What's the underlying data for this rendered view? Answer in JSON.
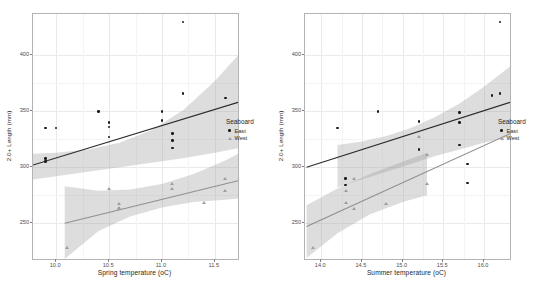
{
  "figure": {
    "panels": [
      "spring",
      "summer"
    ],
    "legend": {
      "title": "Seaboard",
      "items": [
        {
          "label": "East",
          "marker": "filled-circle",
          "color": "#1b1b1b"
        },
        {
          "label": "West",
          "marker": "open-triangle",
          "color": "#9e9e9e"
        }
      ]
    }
  },
  "chart_data": [
    {
      "type": "scatter",
      "panel": "spring",
      "title": "",
      "xlabel": "Spring temperature (oC)",
      "ylabel": "2.0+ Length (mm)",
      "xlim": [
        9.78,
        11.72
      ],
      "ylim": [
        218,
        437
      ],
      "xticks": [
        "10.0",
        "10.5",
        "11.0",
        "11.5"
      ],
      "xtick_values": [
        10.0,
        10.5,
        11.0,
        11.5
      ],
      "yticks": [
        "250",
        "300",
        "350",
        "400"
      ],
      "ytick_values": [
        250,
        300,
        350,
        400
      ],
      "grid": true,
      "legend_position": "right",
      "series": [
        {
          "name": "East",
          "color": "#1b1b1b",
          "marker": "filled-circle",
          "x": [
            9.9,
            9.9,
            9.9,
            10.0,
            10.4,
            10.5,
            10.5,
            10.5,
            11.0,
            11.0,
            11.1,
            11.1,
            11.1,
            11.2,
            11.2,
            11.6
          ],
          "y": [
            308,
            305,
            335,
            335,
            350,
            340,
            336,
            327,
            350,
            342,
            330,
            324,
            317,
            430,
            366,
            362
          ],
          "fit": {
            "x0": 9.78,
            "y0": 302,
            "x1": 11.72,
            "y1": 358
          },
          "band": {
            "x": [
              9.78,
              10.0,
              10.3,
              10.6,
              10.9,
              11.2,
              11.5,
              11.72
            ],
            "upper": [
              312,
              313,
              316,
              322,
              333,
              351,
              377,
              400
            ],
            "lower": [
              289,
              292,
              296,
              300,
              304,
              308,
              313,
              317
            ]
          }
        },
        {
          "name": "West",
          "color": "#9e9e9e",
          "marker": "open-triangle",
          "x": [
            10.1,
            10.5,
            10.6,
            10.6,
            10.6,
            11.1,
            11.1,
            11.4,
            11.6,
            11.6
          ],
          "y": [
            228,
            281,
            267,
            264,
            263,
            285,
            281,
            268,
            290,
            279
          ],
          "fit": {
            "x0": 10.08,
            "y0": 250,
            "x1": 11.72,
            "y1": 288
          },
          "band": {
            "x": [
              10.08,
              10.4,
              10.7,
              11.0,
              11.3,
              11.6,
              11.72
            ],
            "upper": [
              283,
              279,
              280,
              285,
              294,
              306,
              312
            ],
            "lower": [
              218,
              243,
              256,
              264,
              269,
              271,
              272
            ]
          }
        }
      ]
    },
    {
      "type": "scatter",
      "panel": "summer",
      "title": "",
      "xlabel": "Summer temperature (oC)",
      "ylabel": "2.0+ Length (mm)",
      "xlim": [
        13.8,
        16.32
      ],
      "ylim": [
        218,
        437
      ],
      "xticks": [
        "14.0",
        "14.5",
        "15.0",
        "15.5",
        "16.0"
      ],
      "xtick_values": [
        14.0,
        14.5,
        15.0,
        15.5,
        16.0
      ],
      "yticks": [
        "250",
        "300",
        "350",
        "400"
      ],
      "ytick_values": [
        250,
        300,
        350,
        400
      ],
      "grid": true,
      "legend_position": "right",
      "series": [
        {
          "name": "East",
          "color": "#1b1b1b",
          "marker": "filled-circle",
          "x": [
            14.2,
            14.3,
            14.3,
            14.7,
            15.2,
            15.2,
            15.2,
            15.7,
            15.7,
            15.7,
            15.8,
            15.8,
            16.1,
            16.2,
            16.2
          ],
          "y": [
            335,
            290,
            284,
            350,
            341,
            327,
            316,
            349,
            340,
            320,
            303,
            286,
            364,
            430,
            366
          ],
          "fit": {
            "x0": 13.82,
            "y0": 300,
            "x1": 16.32,
            "y1": 358
          },
          "band": {
            "x": [
              14.2,
              14.5,
              14.8,
              15.1,
              15.4,
              15.7,
              16.0,
              16.32
            ],
            "upper": [
              320,
              323,
              328,
              335,
              345,
              357,
              372,
              390
            ],
            "lower": [
              282,
              289,
              296,
              303,
              310,
              316,
              322,
              327
            ]
          }
        },
        {
          "name": "West",
          "color": "#9e9e9e",
          "marker": "open-triangle",
          "x": [
            13.9,
            14.3,
            14.3,
            14.4,
            14.4,
            14.8,
            15.2,
            15.3,
            15.3
          ],
          "y": [
            228,
            279,
            268,
            290,
            263,
            267,
            327,
            311,
            285
          ],
          "fit": {
            "x0": 13.82,
            "y0": 247,
            "x1": 16.32,
            "y1": 330
          },
          "band": {
            "x": [
              13.82,
              14.2,
              14.6,
              15.0,
              15.3
            ],
            "upper": [
              266,
              281,
              294,
              305,
              313
            ],
            "lower": [
              219,
              241,
              258,
              269,
              275
            ]
          }
        }
      ]
    }
  ]
}
